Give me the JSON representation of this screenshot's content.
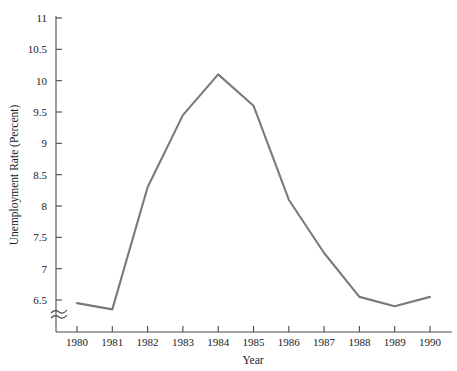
{
  "chart_data": {
    "type": "line",
    "title": "",
    "subtitle": "",
    "xlabel": "Year",
    "ylabel": "Unemployment Rate (Percent)",
    "x": [
      1980,
      1981,
      1982,
      1983,
      1984,
      1985,
      1986,
      1987,
      1988,
      1989,
      1990
    ],
    "categories": [
      "1980",
      "1981",
      "1982",
      "1983",
      "1984",
      "1985",
      "1986",
      "1987",
      "1988",
      "1989",
      "1990"
    ],
    "values": [
      6.45,
      6.35,
      8.3,
      9.45,
      10.1,
      9.6,
      8.1,
      7.25,
      6.55,
      6.4,
      6.55
    ],
    "series": [
      {
        "name": "Unemployment Rate",
        "values": [
          6.45,
          6.35,
          8.3,
          9.45,
          10.1,
          9.6,
          8.1,
          7.25,
          6.55,
          6.4,
          6.55
        ]
      }
    ],
    "xlim": [
      1980,
      1990
    ],
    "ylim": [
      6.5,
      11
    ],
    "y_ticks": [
      6.5,
      7,
      7.5,
      8,
      8.5,
      9,
      9.5,
      10,
      10.5,
      11
    ],
    "y_tick_labels": [
      "6.5",
      "7",
      "7.5",
      "8",
      "8.5",
      "9",
      "9.5",
      "10",
      "10.5",
      "11"
    ],
    "x_ticks": [
      1980,
      1981,
      1982,
      1983,
      1984,
      1985,
      1986,
      1987,
      1988,
      1989,
      1990
    ],
    "x_tick_labels": [
      "1980",
      "1981",
      "1982",
      "1983",
      "1984",
      "1985",
      "1986",
      "1987",
      "1988",
      "1989",
      "1990"
    ],
    "grid": false,
    "legend": false,
    "legend_position": "none",
    "axis_break": true,
    "axis_break_axis": "y",
    "line_color": "#7a7a7a",
    "axis_color": "#4a4a4a",
    "text_color": "#1a1a1a",
    "background_color": "#ffffff"
  }
}
